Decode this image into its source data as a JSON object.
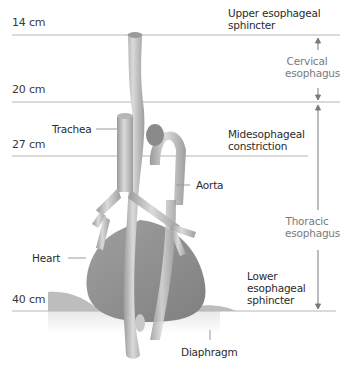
{
  "diagram": {
    "type": "anatomical-diagram",
    "subject": "esophagus",
    "colors": {
      "line": "#b5b5b5",
      "organ_fill": "#8e8e8e",
      "tube_fill": "#c4c4c4",
      "text": "#2b2b2b",
      "section_text": "#7a7a7a"
    },
    "distance_markers": [
      {
        "label": "14 cm",
        "y": 35
      },
      {
        "label": "20 cm",
        "y": 102
      },
      {
        "label": "27 cm",
        "y": 156
      },
      {
        "label": "40 cm",
        "y": 311
      }
    ],
    "right_labels": {
      "upper_sphincter": [
        "Upper esophageal",
        "sphincter"
      ],
      "midesophageal": [
        "Midesophageal",
        "constriction"
      ],
      "lower_sphincter": [
        "Lower",
        "esophageal",
        "sphincter"
      ]
    },
    "sections": {
      "cervical": [
        "Cervical",
        "esophagus"
      ],
      "thoracic": [
        "Thoracic",
        "esophagus"
      ]
    },
    "structure_labels": {
      "trachea": "Trachea",
      "aorta": "Aorta",
      "heart": "Heart",
      "diaphragm": "Diaphragm"
    }
  }
}
